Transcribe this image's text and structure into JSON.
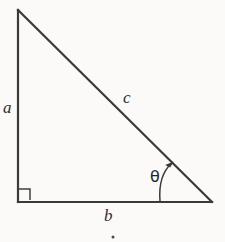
{
  "figure": {
    "name": "right-triangle-diagram",
    "background_color": "#fbfaf8",
    "stroke_color": "#3a3a3a",
    "label_color": "#2f2f2f",
    "width": 225,
    "height": 242
  },
  "labels": {
    "side_a": "a",
    "side_b": "b",
    "side_c": "c",
    "angle_theta": "θ"
  },
  "geometry": {
    "vertices": {
      "apex": {
        "x": 18,
        "y": 10
      },
      "bottom_left": {
        "x": 18,
        "y": 202
      },
      "bottom_right": {
        "x": 212,
        "y": 202
      }
    },
    "sides": [
      {
        "name": "a",
        "role": "vertical-leg",
        "from": "apex",
        "to": "bottom_left"
      },
      {
        "name": "b",
        "role": "horizontal-leg",
        "from": "bottom_left",
        "to": "bottom_right"
      },
      {
        "name": "c",
        "role": "hypotenuse",
        "from": "apex",
        "to": "bottom_right"
      }
    ],
    "right_angle_marker": {
      "x": 19,
      "y": 189,
      "size": 11,
      "at_vertex": "bottom_left"
    },
    "angle_arc": {
      "label": "θ",
      "vertex": "bottom_right",
      "start": {
        "x": 160,
        "y": 201
      },
      "end": {
        "x": 172,
        "y": 163
      },
      "control": {
        "x": 158,
        "y": 175
      },
      "arrowhead_at": "end"
    },
    "stray_mark": {
      "x": 113,
      "y": 237,
      "size": 3
    }
  }
}
